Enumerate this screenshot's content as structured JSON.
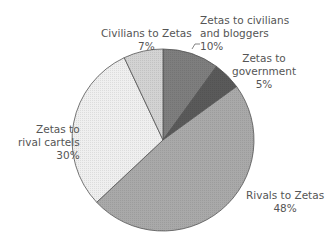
{
  "chart_data": {
    "type": "pie",
    "title": "",
    "start_angle_deg": 0,
    "direction": "clockwise",
    "slices": [
      {
        "label": "Zetas to civilians and bloggers",
        "value": 10,
        "pct_label": "10%",
        "color": "#7e7e7e"
      },
      {
        "label": "Zetas to government",
        "value": 5,
        "pct_label": "5%",
        "color": "#5a5a5a"
      },
      {
        "label": "Rivals to Zetas",
        "value": 48,
        "pct_label": "48%",
        "color": "#a9a9a9"
      },
      {
        "label": "Zetas to rival cartels",
        "value": 30,
        "pct_label": "30%",
        "color": "#efefef"
      },
      {
        "label": "Civilians to Zetas",
        "value": 7,
        "pct_label": "7%",
        "color": "#d3d3d3"
      }
    ],
    "legend": "none (direct labels)"
  },
  "labels": {
    "civ_to_zetas": {
      "line1": "Civilians to Zetas",
      "line2": "7%"
    },
    "zetas_to_civ": {
      "line1": "Zetas to civilians",
      "line2": "and bloggers",
      "line3": "10%"
    },
    "zetas_to_gov": {
      "line1": "Zetas to",
      "line2": "government",
      "line3": "5%"
    },
    "zetas_to_rival": {
      "line1": "Zetas to",
      "line2": "rival cartels",
      "line3": "30%"
    },
    "rivals_to_zetas": {
      "line1": "Rivals to Zetas",
      "line2": "48%"
    }
  }
}
